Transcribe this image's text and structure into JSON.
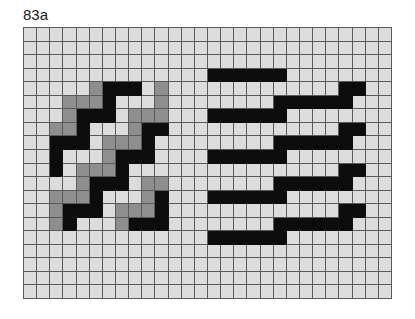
{
  "figure": {
    "label": "83a",
    "grid": {
      "columns": 28,
      "rows": 20
    },
    "colors": {
      "background": "#dcdcdc",
      "gridline": "#5a5a5a",
      "gray": "#8e8e8e",
      "black": "#0c0c0c"
    },
    "legend_codes": {
      ".": "light",
      "G": "gray",
      "B": "black"
    },
    "left_pattern": {
      "description": "interlocking staircase of black and gray cells",
      "col_offset": 2,
      "row_offset": 4,
      "rows": [
        "...GBBB.G",
        ".GGGB...G",
        ".GBBB.GGG",
        "GGB...GBB",
        "BBB.GGGB.",
        "B...GBBB.",
        "B.GGGB...",
        "..GBBB.GG",
        "GGGB...GB",
        "GBBB.GGGB",
        "GB...GBBB"
      ]
    },
    "right_pattern": {
      "description": "stepped black horizontal bars",
      "bars": [
        {
          "row": 3,
          "col_start": 14,
          "col_end": 19
        },
        {
          "row": 4,
          "col_start": 24,
          "col_end": 25
        },
        {
          "row": 5,
          "col_start": 19,
          "col_end": 24
        },
        {
          "row": 6,
          "col_start": 14,
          "col_end": 19
        },
        {
          "row": 7,
          "col_start": 24,
          "col_end": 25
        },
        {
          "row": 8,
          "col_start": 19,
          "col_end": 24
        },
        {
          "row": 9,
          "col_start": 14,
          "col_end": 19
        },
        {
          "row": 10,
          "col_start": 24,
          "col_end": 25
        },
        {
          "row": 11,
          "col_start": 19,
          "col_end": 24
        },
        {
          "row": 12,
          "col_start": 14,
          "col_end": 19
        },
        {
          "row": 13,
          "col_start": 24,
          "col_end": 25
        },
        {
          "row": 14,
          "col_start": 19,
          "col_end": 24
        },
        {
          "row": 15,
          "col_start": 14,
          "col_end": 19
        }
      ]
    }
  }
}
